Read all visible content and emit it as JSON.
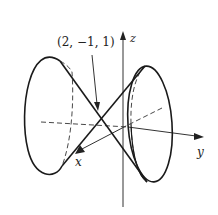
{
  "figure": {
    "type": "3d-double-cone",
    "point_label": "(2, −1, 1)",
    "axes": {
      "x_label": "x",
      "y_label": "y",
      "z_label": "z"
    },
    "colors": {
      "stroke": "#1a1a1a",
      "background": "#ffffff"
    }
  }
}
